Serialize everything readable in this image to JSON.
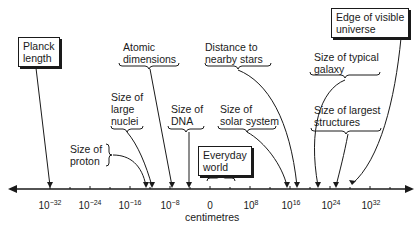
{
  "diagram": {
    "axis": {
      "title": "centimetres",
      "ticks": [
        {
          "base": "10",
          "exp": "−32",
          "value": -32
        },
        {
          "base": "10",
          "exp": "−24",
          "value": -24
        },
        {
          "base": "10",
          "exp": "−16",
          "value": -16
        },
        {
          "base": "10",
          "exp": "−8",
          "value": -8
        },
        {
          "base": "0",
          "exp": "",
          "value": 0
        },
        {
          "base": "10",
          "exp": "8",
          "value": 8
        },
        {
          "base": "10",
          "exp": "16",
          "value": 16
        },
        {
          "base": "10",
          "exp": "24",
          "value": 24
        },
        {
          "base": "10",
          "exp": "32",
          "value": 32
        }
      ]
    },
    "labels": {
      "planck": "Planck\nlength",
      "proton": "Size of\nproton",
      "nuclei": "Size of\nlarge\nnuclei",
      "atomic": "Atomic\ndimensions",
      "dna": "Size of\nDNA",
      "everyday": "Everyday\nworld",
      "stars": "Distance to\nnearby stars",
      "solar": "Size of\nsolar system",
      "galaxy": "Size of typical\ngalaxy",
      "structures": "Size of largest\nstructures",
      "universe": "Edge of visible\nuniverse"
    }
  }
}
